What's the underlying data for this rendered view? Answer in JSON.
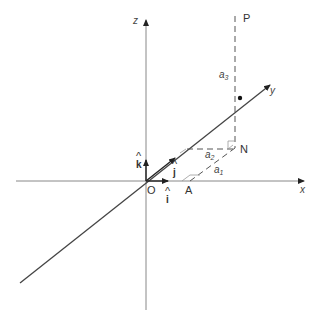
{
  "diagram": {
    "type": "3d-coordinate-vector-diagram",
    "axes": {
      "x": {
        "label": "x"
      },
      "y": {
        "label": "y"
      },
      "z": {
        "label": "z"
      }
    },
    "points": {
      "origin": "O",
      "p": "P",
      "n": "N",
      "a": "A"
    },
    "unit_vectors": {
      "i": {
        "hat": "^",
        "label": "i"
      },
      "j": {
        "hat": "^",
        "label": "j"
      },
      "k": {
        "hat": "^",
        "label": "k"
      }
    },
    "components": {
      "a1": {
        "base": "a",
        "sub": "1"
      },
      "a2": {
        "base": "a",
        "sub": "2"
      },
      "a3": {
        "base": "a",
        "sub": "3"
      }
    },
    "colors": {
      "axis": "#888888",
      "line": "#444444",
      "text": "#333333",
      "background": "#ffffff"
    }
  }
}
